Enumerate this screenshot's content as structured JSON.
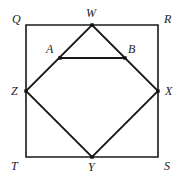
{
  "figure": {
    "kind": "geometry-diagram",
    "width": 182,
    "height": 181,
    "background_color": "#ffffff",
    "stroke_color": "#1a1a1a",
    "square_stroke_width": 1.6,
    "diamond_stroke_width": 1.8,
    "chord_stroke_width": 2.0,
    "vertex_dot_color": "#111111",
    "vertex_dot_size": 3.4,
    "label_color": "#1a1a1a",
    "label_font_size": 12
  },
  "points": {
    "Q": {
      "label": "Q",
      "x": 26,
      "y": 25,
      "label_x": 12,
      "label_y": 13,
      "dot": false
    },
    "R": {
      "label": "R",
      "x": 158,
      "y": 25,
      "label_x": 164,
      "label_y": 13,
      "dot": false
    },
    "S": {
      "label": "S",
      "x": 158,
      "y": 157,
      "label_x": 164,
      "label_y": 160,
      "dot": false
    },
    "T": {
      "label": "T",
      "x": 26,
      "y": 157,
      "label_x": 11,
      "label_y": 160,
      "dot": false
    },
    "W": {
      "label": "W",
      "x": 92,
      "y": 25,
      "label_x": 86,
      "label_y": 7,
      "dot": true
    },
    "X": {
      "label": "X",
      "x": 158,
      "y": 91,
      "label_x": 165,
      "label_y": 85,
      "dot": true
    },
    "Y": {
      "label": "Y",
      "x": 92,
      "y": 157,
      "label_x": 88,
      "label_y": 161,
      "dot": true
    },
    "Z": {
      "label": "Z",
      "x": 26,
      "y": 91,
      "label_x": 11,
      "label_y": 85,
      "dot": true
    },
    "A": {
      "label": "A",
      "x": 60,
      "y": 58,
      "label_x": 46,
      "label_y": 43,
      "dot": true
    },
    "B": {
      "label": "B",
      "x": 125,
      "y": 58,
      "label_x": 128,
      "label_y": 43,
      "dot": true
    }
  },
  "shapes": {
    "square": {
      "name": "QRST",
      "vertices": [
        "Q",
        "R",
        "S",
        "T"
      ],
      "closed": true
    },
    "diamond": {
      "name": "WXYZ",
      "vertices": [
        "W",
        "X",
        "Y",
        "Z"
      ],
      "closed": true
    },
    "chord": {
      "name": "AB",
      "vertices": [
        "A",
        "B"
      ],
      "closed": false
    }
  },
  "label_order": [
    "Q",
    "W",
    "R",
    "A",
    "B",
    "Z",
    "X",
    "T",
    "Y",
    "S"
  ],
  "dot_order": [
    "W",
    "X",
    "Y",
    "Z",
    "A",
    "B"
  ]
}
